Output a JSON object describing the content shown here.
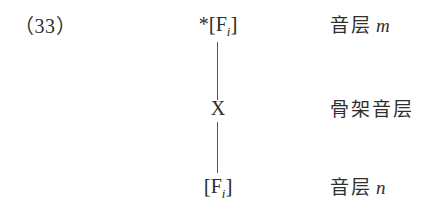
{
  "figure": {
    "example_number": "（33）",
    "background_color": "#ffffff",
    "text_color": "#2c2c2b",
    "line_color": "#55555a"
  },
  "nodes": [
    {
      "id": "top",
      "asterisk": "*",
      "open_bracket": "[",
      "segment": "F",
      "subscript": "i",
      "close_bracket": "]",
      "full_text": "*[Fi]"
    },
    {
      "id": "middle",
      "asterisk": "",
      "open_bracket": "",
      "segment": "X",
      "subscript": "",
      "close_bracket": "",
      "full_text": "X"
    },
    {
      "id": "bottom",
      "asterisk": "",
      "open_bracket": "[",
      "segment": "F",
      "subscript": "i",
      "close_bracket": "]",
      "full_text": "[Fi]"
    }
  ],
  "layer_labels": [
    {
      "id": "top",
      "han": "音层",
      "latin": "m"
    },
    {
      "id": "middle",
      "han": "骨架音层",
      "latin": ""
    },
    {
      "id": "bottom",
      "han": "音层",
      "latin": "n"
    }
  ],
  "association_lines": [
    {
      "id": "upper",
      "from": "top",
      "to": "middle"
    },
    {
      "id": "lower",
      "from": "middle",
      "to": "bottom"
    }
  ]
}
